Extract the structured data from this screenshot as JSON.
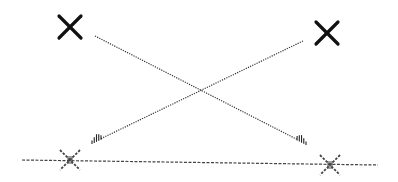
{
  "diagram": {
    "colors": {
      "stroke": "#111111",
      "dotted": "#333333",
      "dashed": "#444444",
      "background": "#ffffff"
    },
    "markers": [
      {
        "id": "top-left-x",
        "style": "solid",
        "cx": 70,
        "cy": 27,
        "size": 11
      },
      {
        "id": "top-right-x",
        "style": "solid",
        "cx": 327,
        "cy": 33,
        "size": 11
      },
      {
        "id": "bottom-left-x",
        "style": "dashed",
        "cx": 70,
        "cy": 160,
        "size": 10
      },
      {
        "id": "bottom-right-x",
        "style": "dashed",
        "cx": 330,
        "cy": 165,
        "size": 10
      }
    ],
    "arrows": [
      {
        "id": "arrow-left-to-right",
        "x1": 95,
        "y1": 36,
        "x2": 306,
        "y2": 144
      },
      {
        "id": "arrow-right-to-left",
        "x1": 303,
        "y1": 41,
        "x2": 92,
        "y2": 143
      }
    ],
    "baseline": {
      "x1": 22,
      "y1": 160,
      "x2": 378,
      "y2": 165
    }
  }
}
